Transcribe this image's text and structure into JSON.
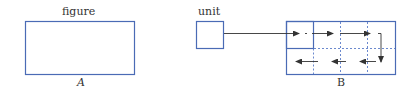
{
  "figure_panel": {
    "top_label": "figure",
    "bottom_label": "A"
  },
  "unit_panel": {
    "top_label": "unit"
  },
  "result_panel": {
    "bottom_label": "B"
  },
  "colors": {
    "box_stroke": "#4a6bb5",
    "dashed_stroke": "#5a7cc8",
    "arrow": "#333333"
  }
}
